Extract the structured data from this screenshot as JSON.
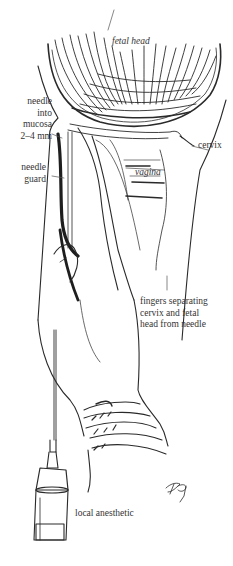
{
  "figure": {
    "type": "medical-line-illustration"
  },
  "labels": {
    "fetal_head": "fetal head",
    "needle_into_mucosa": [
      "needle",
      "into",
      "mucosa",
      "2–4 mm"
    ],
    "needle_guard": [
      "needle",
      "guard"
    ],
    "cervix": "cervix",
    "vagina": "vagina",
    "fingers": [
      "fingers separating",
      "cervix and fetal",
      "head from needle"
    ],
    "local_anesthetic": "local anesthetic",
    "signature": "artist signature"
  },
  "colors": {
    "ink": "#2a2a2a",
    "label_text": "#333333",
    "background": "#ffffff"
  }
}
